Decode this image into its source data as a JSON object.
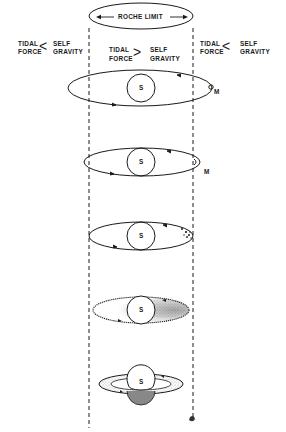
{
  "figure": {
    "type": "diagram"
  },
  "roche_limit": {
    "label": "ROCHE LIMIT"
  },
  "zones": {
    "left": {
      "line1": "TIDAL",
      "line2": "FORCE",
      "comparator": "<",
      "rline1": "SELF",
      "rline2": "GRAVITY"
    },
    "center": {
      "line1": "TIDAL",
      "line2": "FORCE",
      "comparator": ">",
      "rline1": "SELF",
      "rline2": "GRAVITY"
    },
    "right": {
      "line1": "TIDAL",
      "line2": "FORCE",
      "comparator": "<",
      "rline1": "SELF",
      "rline2": "GRAVITY"
    }
  },
  "stages": [
    {
      "planet_label": "S",
      "moon_label": "M",
      "description": "eccentric orbit of moon crossing Roche limit"
    },
    {
      "planet_label": "S",
      "moon_label": "M",
      "description": "moon at apoapsis near Roche limit"
    },
    {
      "planet_label": "S",
      "description": "moon breaking into fragments"
    },
    {
      "planet_label": "S",
      "description": "debris spread along orbit"
    },
    {
      "planet_label": "S",
      "description": "debris forms ring around planet"
    }
  ]
}
